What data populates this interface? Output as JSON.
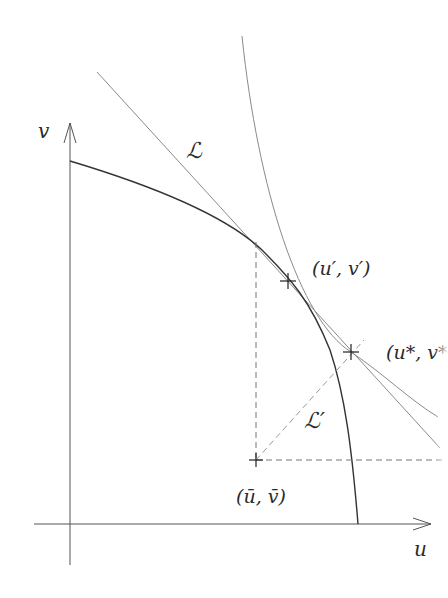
{
  "diagram": {
    "axes": {
      "x_label": "u",
      "y_label": "v",
      "origin": [
        70,
        524
      ],
      "x_arrow_tip": [
        431,
        524
      ],
      "y_arrow_tip": [
        70,
        123
      ]
    },
    "labels": {
      "line_L": "ℒ",
      "line_L_prime": "ℒ′",
      "point_prime": "(u′, v′)",
      "point_star": "(u*, v*",
      "point_bar": "(ū, v̄)"
    },
    "points": {
      "prime": [
        288,
        281
      ],
      "star": [
        351,
        352
      ],
      "bar": [
        256,
        460
      ]
    },
    "colors": {
      "axis": "#555555",
      "frontier": "#333333",
      "thin_line": "#8a8a8a",
      "dashed": "#777777",
      "text": "#2a2a2a"
    }
  }
}
